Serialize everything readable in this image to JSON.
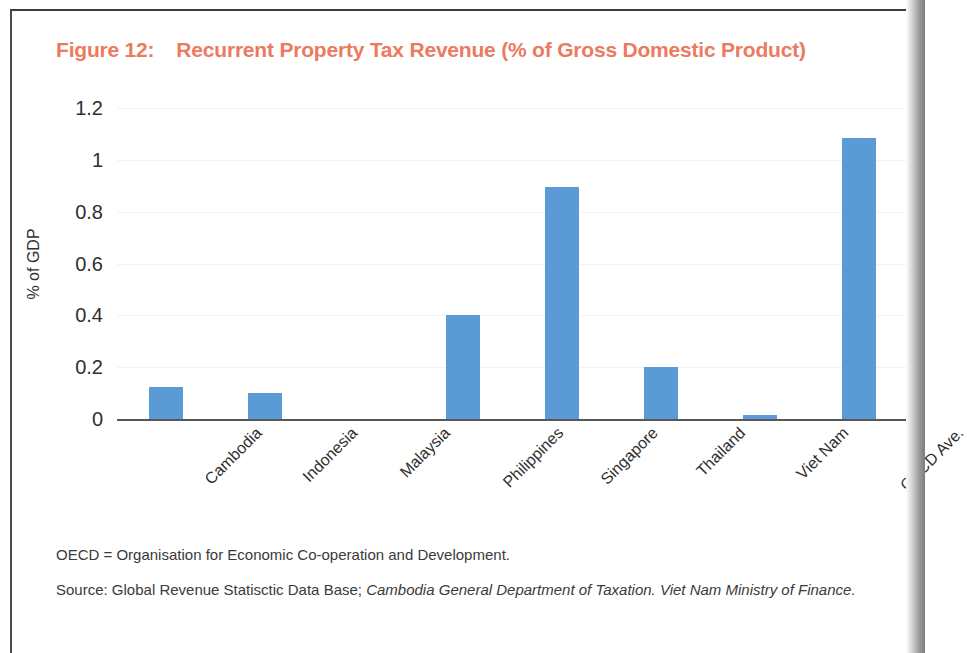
{
  "figure": {
    "label": "Figure 12:",
    "title": "Recurrent Property Tax Revenue (% of Gross Domestic Product)",
    "title_color": "#ec7a5f"
  },
  "notes": {
    "abbreviation": "OECD = Organisation for Economic Co-operation and Development.",
    "source_prefix": "Source: Global Revenue Statisctic Data Base; ",
    "source_italic": "Cambodia General Department of Taxation. Viet Nam Ministry of Finance."
  },
  "chart_data": {
    "type": "bar",
    "title": "Recurrent Property Tax Revenue (% of Gross Domestic Product)",
    "xlabel": "",
    "ylabel": "% of GDP",
    "categories": [
      "Cambodia",
      "Indonesia",
      "Malaysia",
      "Philippines",
      "Singapore",
      "Thailand",
      "Viet Nam",
      "OECD Ave."
    ],
    "values": [
      0.125,
      0.1,
      0,
      0.4,
      0.895,
      0.2,
      0.015,
      1.085
    ],
    "ylim": [
      0,
      1.2
    ],
    "yticks": [
      "0",
      "0.2",
      "0.4",
      "0.6",
      "0.8",
      "1",
      "1.2"
    ],
    "ytick_values": [
      0,
      0.2,
      0.4,
      0.6,
      0.8,
      1,
      1.2
    ],
    "grid": true,
    "legend": false,
    "bar_color": "#5b9bd5",
    "series": [
      {
        "name": "% of GDP",
        "values": [
          0.125,
          0.1,
          0,
          0.4,
          0.895,
          0.2,
          0.015,
          1.085
        ]
      }
    ]
  }
}
